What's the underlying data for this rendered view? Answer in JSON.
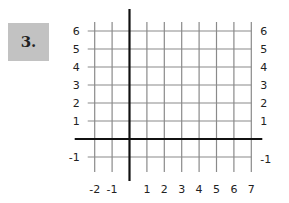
{
  "problem": {
    "number_label": "3."
  },
  "chart_data": {
    "type": "grid",
    "title": "",
    "xlabel": "",
    "ylabel": "",
    "xlim": [
      -2,
      7
    ],
    "ylim": [
      -1,
      6
    ],
    "grid": true,
    "x_ticks": [
      -2,
      -1,
      1,
      2,
      3,
      4,
      5,
      6,
      7
    ],
    "y_ticks_left": [
      6,
      5,
      4,
      3,
      2,
      1,
      -1
    ],
    "y_ticks_right": [
      6,
      5,
      4,
      3,
      2,
      1,
      -1
    ],
    "x_tick_labels": [
      "-2",
      "-1",
      "1",
      "2",
      "3",
      "4",
      "5",
      "6",
      "7"
    ],
    "y_tick_labels_left": [
      "6",
      "5",
      "4",
      "3",
      "2",
      "1",
      "-1"
    ],
    "y_tick_labels_right": [
      "6",
      "5",
      "4",
      "3",
      "2",
      "1",
      "-1"
    ]
  }
}
